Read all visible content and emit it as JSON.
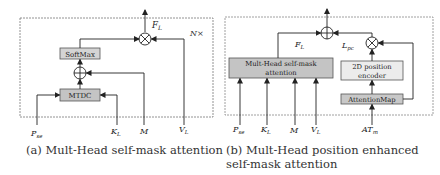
{
  "diagram_a": {
    "frame_label": "N×",
    "boxes": {
      "softmax": "SoftMax",
      "mtdc": "MTDC"
    },
    "output_label": "F",
    "output_sub": "L",
    "inputs": [
      {
        "main": "P",
        "sub": "se"
      },
      {
        "main": "K",
        "sub": "L"
      },
      {
        "main": "M",
        "sub": ""
      },
      {
        "main": "V",
        "sub": "L"
      }
    ],
    "caption": "(a) Mult-Head self-mask attention"
  },
  "diagram_b": {
    "boxes": {
      "mhsa_line1": "Mult-Head self-mask",
      "mhsa_line2": "attention",
      "pos_line1": "2D position",
      "pos_line2": "encoder",
      "attmap": "AttentionMap"
    },
    "fl_label": "F",
    "fl_sub": "L",
    "lpc_label": "L",
    "lpc_sub": "pc",
    "inputs": [
      {
        "main": "P",
        "sub": "se"
      },
      {
        "main": "K",
        "sub": "L"
      },
      {
        "main": "M",
        "sub": ""
      },
      {
        "main": "V",
        "sub": "L"
      },
      {
        "main": "AT",
        "sub": "m"
      }
    ],
    "caption": "(b) Mult-Head position enhanced self-mask attention"
  },
  "colors": {
    "box_fill_dark": "#c8c8c8",
    "box_fill_light": "#e6e6e6",
    "line": "#333333",
    "frame": "#555555"
  }
}
